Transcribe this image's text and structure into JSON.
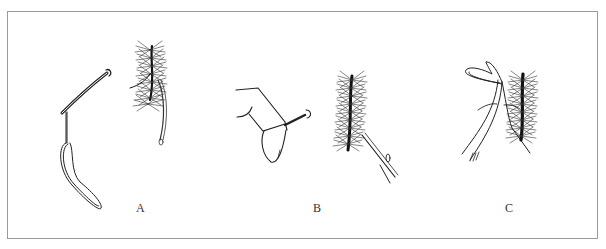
{
  "figure": {
    "panels": [
      {
        "id": "A",
        "label": "A",
        "description": "Needle with looped thread beside feathered hackle"
      },
      {
        "id": "B",
        "label": "B",
        "description": "Fingers holding needle; hackle with thread being drawn"
      },
      {
        "id": "C",
        "label": "C",
        "description": "Forceps pulling thread loop through hackle"
      }
    ],
    "colors": {
      "frame": "#9a9a9a",
      "ink": "#222222",
      "background": "#ffffff"
    }
  }
}
